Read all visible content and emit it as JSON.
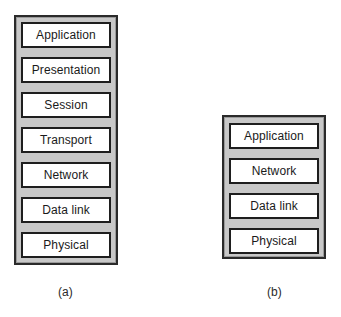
{
  "diagram": {
    "title": "",
    "stacks": [
      {
        "id": "a",
        "caption": "(a)",
        "layers": [
          "Application",
          "Presentation",
          "Session",
          "Transport",
          "Network",
          "Data link",
          "Physical"
        ]
      },
      {
        "id": "b",
        "caption": "(b)",
        "layers": [
          "Application",
          "Network",
          "Data link",
          "Physical"
        ]
      }
    ],
    "colors": {
      "stack_fill": "#c8c8c8",
      "stack_border": "#2a2a2a",
      "layer_fill": "#ffffff",
      "layer_border": "#1e1e1e",
      "text": "#1a1a1a"
    }
  }
}
